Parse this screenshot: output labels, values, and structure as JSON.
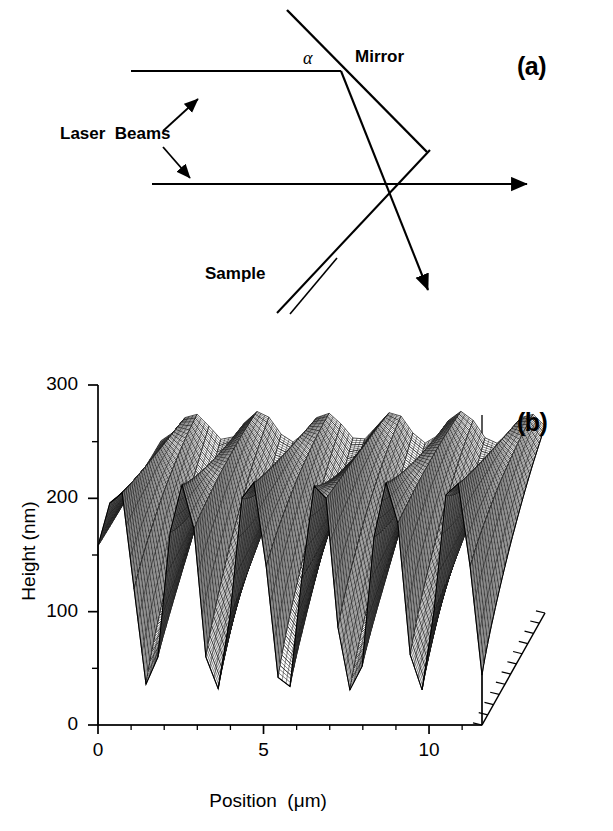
{
  "figure": {
    "panels": [
      {
        "letter": "(a)",
        "type": "schematic",
        "caption_labels": {
          "mirror": "Mirror",
          "laser_beams": "Laser  Beams",
          "sample": "Sample",
          "angle": "α"
        }
      },
      {
        "letter": "(b)",
        "type": "surface-plot"
      }
    ]
  },
  "chart_data": {
    "type": "line",
    "render": "3d-surface-waterfall",
    "title": "",
    "subtitle": "",
    "xlabel": "Position  (μm)",
    "ylabel": "Height (nm)",
    "zlabel": "",
    "xlim": [
      0,
      11.6
    ],
    "ylim": [
      0,
      300
    ],
    "grid": false,
    "legend": "none",
    "x_major_ticks": [
      0,
      5,
      10
    ],
    "x_major_tick_labels": [
      "0",
      "5",
      "10"
    ],
    "x_minor_tick_step": 1,
    "y_major_ticks": [
      0,
      100,
      200,
      300
    ],
    "y_major_tick_labels": [
      "0",
      "100",
      "200",
      "300"
    ],
    "y_minor_ticks": [
      50,
      150,
      250
    ],
    "depth_tick_count": 11,
    "grating_period_um": 1.28,
    "front_profile_mean_nm": 122,
    "front_profile_amplitude_nm": 93,
    "back_profile_mean_nm": 170,
    "back_profile_amplitude_nm": 28,
    "peak_height_nm": 215,
    "trough_height_nm": 30,
    "n_periods": 9,
    "n_profile_lines": 34,
    "x": [
      0,
      0.36,
      0.73,
      1.09,
      1.45,
      1.81,
      2.18,
      2.54,
      2.9,
      3.26,
      3.63,
      3.99,
      4.35,
      4.71,
      5.08,
      5.44,
      5.8,
      6.16,
      6.53,
      6.89,
      7.25,
      7.61,
      7.98,
      8.34,
      8.7,
      9.06,
      9.43,
      9.79,
      10.15,
      10.51,
      10.88,
      11.24,
      11.6
    ],
    "front_edge_height_nm": [
      158,
      196,
      205,
      120,
      36,
      60,
      170,
      212,
      173,
      60,
      32,
      96,
      200,
      214,
      140,
      42,
      34,
      130,
      211,
      200,
      86,
      31,
      52,
      166,
      214,
      178,
      62,
      31,
      100,
      203,
      213,
      140,
      44
    ],
    "back_edge_height_nm": [
      152,
      168,
      178,
      172,
      156,
      150,
      162,
      176,
      180,
      164,
      150,
      152,
      168,
      178,
      174,
      158,
      150,
      158,
      174,
      180,
      166,
      150,
      150,
      164,
      178,
      178,
      160,
      148,
      152,
      168,
      178,
      172,
      156
    ]
  }
}
